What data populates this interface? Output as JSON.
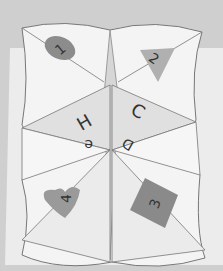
{
  "scene": {
    "subject": "paper fortune teller (cootie catcher)",
    "background_color": "#cfcfcf",
    "paper_color": "#f4f4f4",
    "fold_shade_color": "#dadada",
    "base_card_color": "#f0f0f0"
  },
  "flaps": [
    {
      "position": "top-left",
      "shape": "circle",
      "number": "1",
      "color": "#8c8c8c"
    },
    {
      "position": "top-right",
      "shape": "triangle",
      "number": "2",
      "color": "#b0b0b0"
    },
    {
      "position": "bottom-right",
      "shape": "square",
      "number": "3",
      "color": "#8a8a8a"
    },
    {
      "position": "bottom-left",
      "shape": "heart",
      "number": "4",
      "color": "#9a9a9a"
    }
  ],
  "center_letters": {
    "top_left": "H",
    "top_right": "C",
    "bottom_left": "e",
    "bottom_right": "D"
  }
}
